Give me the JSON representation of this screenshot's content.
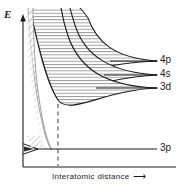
{
  "figure": {
    "type": "diagram",
    "axes": {
      "y_label": "E",
      "y_label_meaning": "energy",
      "x_label": "Interatomic distance",
      "x_label_arrow": "⟶",
      "y_axis_arrow": "up",
      "x_axis_arrow": "right",
      "grid": "none",
      "ticks": "none"
    },
    "levels": [
      {
        "id": "4p",
        "label": "4p",
        "line_y": 61,
        "line_x_start": 110,
        "line_x_end": 157,
        "label_x": 160,
        "label_y": 55
      },
      {
        "id": "4s",
        "label": "4s",
        "line_y": 75,
        "line_x_start": 104,
        "line_x_end": 157,
        "label_x": 160,
        "label_y": 69
      },
      {
        "id": "3d",
        "label": "3d",
        "line_y": 88,
        "line_x_start": 96,
        "line_x_end": 157,
        "label_x": 160,
        "label_y": 82
      },
      {
        "id": "3p",
        "label": "3p",
        "line_y": 149,
        "line_x_start": 36,
        "line_x_end": 157,
        "label_x": 160,
        "label_y": 143
      }
    ],
    "bands": [
      {
        "id": "4p-band",
        "hatch": "horizontal",
        "converges_to": "4p"
      },
      {
        "id": "4s-band",
        "hatch": "horizontal",
        "converges_to": "4s"
      },
      {
        "id": "3d-band",
        "hatch": "horizontal",
        "converges_to": "3d"
      },
      {
        "id": "left-diagonal-region",
        "hatch": "diagonal",
        "converges_to": "none"
      },
      {
        "id": "3p-band",
        "hatch": "wedge",
        "converges_to": "3p"
      }
    ],
    "equilibrium_marker": {
      "style": "dashed-vertical",
      "x": 58,
      "y_top": 104,
      "y_bottom": 167
    },
    "colors": {
      "ink": "#1d1d1d",
      "hatch": "#6d6d6d",
      "background": "#ffffff"
    }
  }
}
